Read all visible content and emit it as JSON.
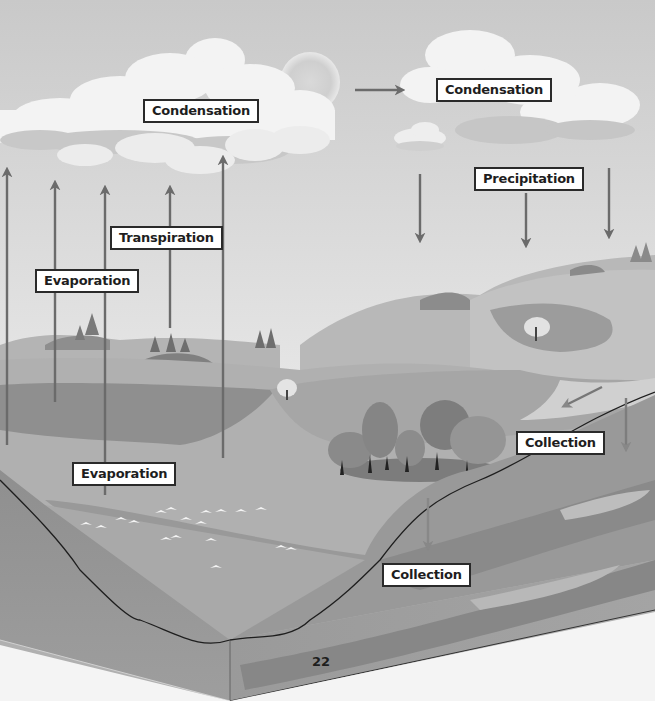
{
  "diagram": {
    "color_mode": "grayscale",
    "labels": [
      {
        "id": "condensation-left",
        "text": "Condensation"
      },
      {
        "id": "condensation-right",
        "text": "Condensation"
      },
      {
        "id": "precipitation",
        "text": "Precipitation"
      },
      {
        "id": "transpiration",
        "text": "Transpiration"
      },
      {
        "id": "evaporation-upper",
        "text": "Evaporation"
      },
      {
        "id": "evaporation-lower",
        "text": "Evaporation"
      },
      {
        "id": "collection-right",
        "text": "Collection"
      },
      {
        "id": "collection-lower",
        "text": "Collection"
      }
    ],
    "arrows": {
      "upward_evaporation_transpiration": 6,
      "sky_horizontal": 1,
      "precipitation_downward": 3,
      "runoff_diagonal": 1,
      "groundwater_downward": 2
    },
    "page_number": "22"
  },
  "colors": {
    "sky": "#d8d8d8",
    "cloud": "#f2f2f2",
    "cloud_shadow": "#bdbdbd",
    "arrow": "#6b6b6b",
    "ground": "#9a9a9a",
    "water": "#a8a8a8",
    "label_border": "#2a2a2a"
  }
}
